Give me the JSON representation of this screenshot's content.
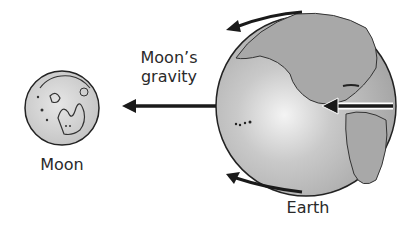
{
  "diagram": {
    "moon": {
      "label": "Moon"
    },
    "earth": {
      "label": "Earth"
    },
    "force_label": {
      "line1": "Moon’s",
      "line2": "gravity"
    },
    "colors": {
      "earth_fill": "#b8b8b8",
      "moon_fill": "#d6d6d6",
      "arrow": "#1a1a1a",
      "text": "#2a2a2a"
    }
  }
}
